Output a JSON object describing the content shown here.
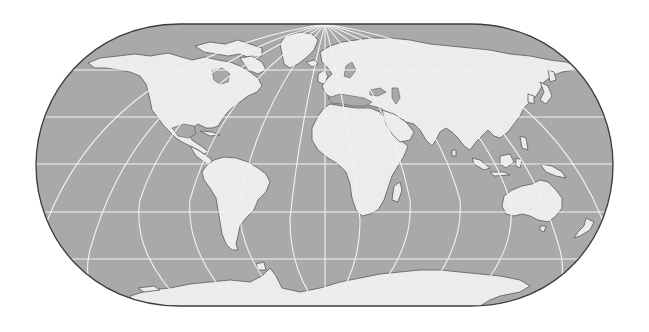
{
  "map": {
    "title": "World map",
    "projection": "pseudocylindrical (rounded-end) world projection with graticule",
    "colors": {
      "ocean": "#a9a9a9",
      "land": "#ececec",
      "coastline": "#5a5a5a",
      "graticule": "#f2f2f2",
      "frame": "#3c3c3c",
      "background": "#ffffff"
    },
    "graticule": {
      "parallels_y_px": [
        70,
        117,
        164,
        212,
        259
      ],
      "meridian_convergence_point": [
        325,
        24
      ]
    },
    "regions": [
      {
        "name": "North America"
      },
      {
        "name": "Greenland"
      },
      {
        "name": "South America"
      },
      {
        "name": "Europe"
      },
      {
        "name": "Africa"
      },
      {
        "name": "Madagascar"
      },
      {
        "name": "Asia"
      },
      {
        "name": "Japan"
      },
      {
        "name": "Indonesia"
      },
      {
        "name": "New Guinea"
      },
      {
        "name": "Australia"
      },
      {
        "name": "New Zealand"
      },
      {
        "name": "Antarctica"
      }
    ]
  }
}
